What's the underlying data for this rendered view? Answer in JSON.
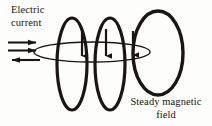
{
  "figure": {
    "background_color": "#fdfdfb",
    "ink_color": "#1a1512",
    "width": 212,
    "height": 126
  },
  "labels": {
    "electric_current": "Electric\ncurrent",
    "steady_magnetic_field": "Steady magnetic\nfield"
  },
  "icons": {
    "current_arrow_right": "arrow-right-icon",
    "current_arrow_left": "arrow-left-icon",
    "field_arrow_down": "arrow-down-icon"
  },
  "diagram_elements": {
    "conductor": {
      "name": "wire-ellipse",
      "shape": "flat-ellipse",
      "center_x": 92,
      "center_y": 52,
      "radius_x": 58,
      "radius_y": 10
    },
    "current_arrows": [
      {
        "direction": "right",
        "x_start": 8,
        "x_end": 40,
        "y": 43
      },
      {
        "direction": "right",
        "x_start": 8,
        "x_end": 40,
        "y": 51
      },
      {
        "direction": "left",
        "x_start": 40,
        "x_end": 8,
        "y": 60
      }
    ],
    "field_loops": [
      {
        "name": "field-loop-1",
        "center_x": 72,
        "center_y": 64,
        "radius_x": 15,
        "radius_y": 46
      },
      {
        "name": "field-loop-2",
        "center_x": 110,
        "center_y": 64,
        "radius_x": 15,
        "radius_y": 46
      },
      {
        "name": "field-loop-large",
        "center_x": 158,
        "center_y": 53,
        "radius_x": 25,
        "radius_y": 42
      }
    ],
    "field_direction_arrows": [
      {
        "name": "field-arrow-1",
        "x": 82,
        "y_start": 30,
        "y_end": 58
      },
      {
        "name": "field-arrow-2",
        "x": 106,
        "y_start": 30,
        "y_end": 58
      },
      {
        "name": "field-arrow-3",
        "x": 133,
        "y_start": 32,
        "y_end": 56
      }
    ]
  }
}
